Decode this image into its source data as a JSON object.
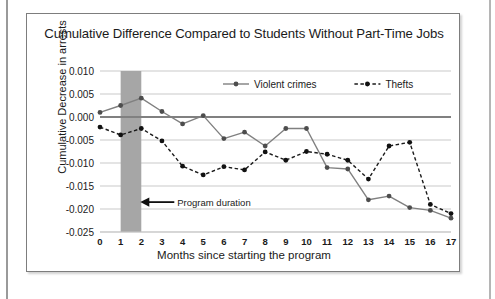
{
  "figure": {
    "title": "Cumulative Difference Compared to Students Without Part-Time Jobs"
  },
  "chart_data": {
    "type": "line",
    "title": "Cumulative Difference Compared to Students Without Part-Time Jobs",
    "xlabel": "Months since starting the program",
    "ylabel": "Cumulative Decrease in arrests",
    "x": [
      0,
      1,
      2,
      3,
      4,
      5,
      6,
      7,
      8,
      9,
      10,
      11,
      12,
      13,
      14,
      15,
      16,
      17
    ],
    "xtick_labels": [
      "0",
      "1",
      "2",
      "3",
      "4",
      "5",
      "6",
      "7",
      "8",
      "9",
      "10",
      "11",
      "12",
      "13",
      "14",
      "15",
      "16",
      "17"
    ],
    "ytick_labels": [
      "0.010",
      "0.005",
      "0.000",
      "-0.005",
      "-0.010",
      "-0.015",
      "-0.020",
      "-0.025"
    ],
    "ytick_values": [
      0.01,
      0.005,
      0.0,
      -0.005,
      -0.01,
      -0.015,
      -0.02,
      -0.025
    ],
    "xlim": [
      0,
      17
    ],
    "ylim": [
      -0.025,
      0.01
    ],
    "grid": true,
    "legend_position": "top-center",
    "series": [
      {
        "name": "Violent crimes",
        "style": "solid",
        "color": "#808080",
        "marker": "circle",
        "marker_color": "#4d4d4d",
        "values": [
          0.001,
          0.0025,
          0.0041,
          0.0012,
          -0.0015,
          0.0003,
          -0.0047,
          -0.0033,
          -0.0063,
          -0.0025,
          -0.0025,
          -0.011,
          -0.0113,
          -0.018,
          -0.0172,
          -0.0197,
          -0.0203,
          -0.022
        ]
      },
      {
        "name": "Thefts",
        "style": "dashed",
        "color": "#1a1a1a",
        "marker": "circle",
        "marker_color": "#111111",
        "values": [
          -0.0022,
          -0.0039,
          -0.0025,
          -0.0052,
          -0.0107,
          -0.0126,
          -0.0108,
          -0.0115,
          -0.0076,
          -0.0094,
          -0.0075,
          -0.0081,
          -0.0094,
          -0.0135,
          -0.0063,
          -0.0055,
          -0.019,
          -0.021
        ]
      }
    ],
    "annotations": [
      {
        "name": "program-duration",
        "label": "Program duration",
        "type": "arrow-label",
        "points_to_x": 2
      }
    ],
    "shaded_band": {
      "name": "program-duration-band",
      "x_start": 1,
      "x_end": 2,
      "color": "#a6a6a6"
    },
    "zero_line": {
      "value": 0.0,
      "color": "#808080"
    }
  }
}
